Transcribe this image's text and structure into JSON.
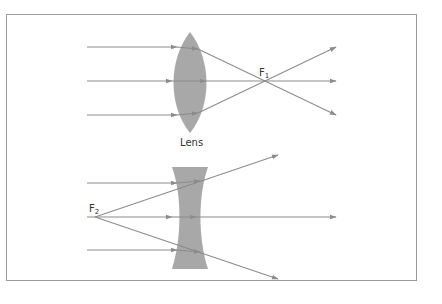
{
  "diagram": {
    "title": "",
    "colors": {
      "frame": "#9a9a9a",
      "lens_fill": "#a8a8a8",
      "ray": "#8c8c8c",
      "text": "#333333"
    },
    "converging_lens": {
      "label": "Lens",
      "focal_point": {
        "letter": "F",
        "subscript": "1"
      }
    },
    "diverging_lens": {
      "focal_point": {
        "letter": "F",
        "subscript": "2"
      }
    }
  }
}
